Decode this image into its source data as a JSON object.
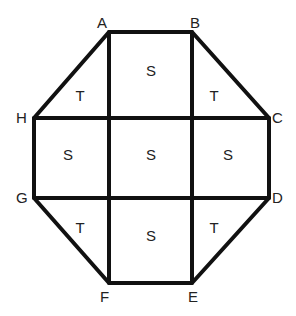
{
  "diagram": {
    "type": "octagon-dissection",
    "points": {
      "A": {
        "label": "A",
        "x": 109,
        "y": 32,
        "lx": 97,
        "ly": 28
      },
      "B": {
        "label": "B",
        "x": 192,
        "y": 32,
        "lx": 190,
        "ly": 28
      },
      "C": {
        "label": "C",
        "x": 269,
        "y": 118,
        "lx": 272,
        "ly": 123
      },
      "D": {
        "label": "D",
        "x": 269,
        "y": 198,
        "lx": 272,
        "ly": 203
      },
      "E": {
        "label": "E",
        "x": 192,
        "y": 283,
        "lx": 188,
        "ly": 302
      },
      "F": {
        "label": "F",
        "x": 109,
        "y": 283,
        "lx": 100,
        "ly": 302
      },
      "G": {
        "label": "G",
        "x": 34,
        "y": 198,
        "lx": 16,
        "ly": 203
      },
      "H": {
        "label": "H",
        "x": 34,
        "y": 118,
        "lx": 16,
        "ly": 123
      }
    },
    "regions": [
      {
        "label": "T",
        "x": 80,
        "y": 101
      },
      {
        "label": "S",
        "x": 151,
        "y": 76
      },
      {
        "label": "T",
        "x": 214,
        "y": 101
      },
      {
        "label": "S",
        "x": 68,
        "y": 160
      },
      {
        "label": "S",
        "x": 151,
        "y": 160
      },
      {
        "label": "S",
        "x": 228,
        "y": 160
      },
      {
        "label": "T",
        "x": 80,
        "y": 233
      },
      {
        "label": "S",
        "x": 151,
        "y": 241
      },
      {
        "label": "T",
        "x": 214,
        "y": 233
      }
    ]
  }
}
